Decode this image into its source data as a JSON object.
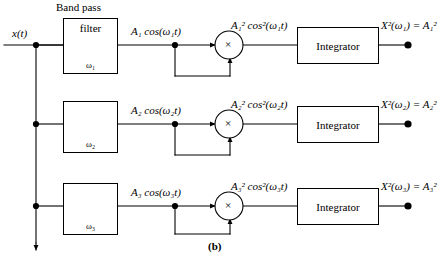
{
  "figure": {
    "caption": "(b)",
    "input_label": "x(t)",
    "bandpass_header": "Band pass",
    "filter_word": "filter",
    "integrator_label": "Integrator"
  },
  "channels": [
    {
      "omega": "ω₁",
      "filter_output": "A₁ cos(ω₁t)",
      "product": "A₁² cos²(ω₁t)",
      "output": "X²(ω₁) = A₁²",
      "multiplier_symbol": "×"
    },
    {
      "omega": "ω₂",
      "filter_output": "A₂ cos(ω₂t)",
      "product": "A₂² cos²(ω₂t)",
      "output": "X²(ω₂) = A₂²",
      "multiplier_symbol": "×"
    },
    {
      "omega": "ω₃",
      "filter_output": "A₃ cos(ω₃t)",
      "product": "A₃² cos²(ω₃t)",
      "output": "X²(ω₃) = A₃²",
      "multiplier_symbol": "×"
    }
  ],
  "colors": {
    "line": "#000000",
    "background": "#ffffff"
  }
}
